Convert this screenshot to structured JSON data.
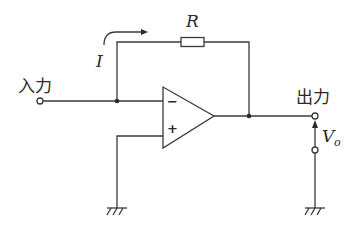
{
  "diagram": {
    "type": "circuit-schematic",
    "labels": {
      "input": "入力",
      "output": "出力",
      "current": "I",
      "resistor": "R",
      "output_voltage_main": "V",
      "output_voltage_sub": "o"
    },
    "opamp": {
      "inverting_sign": "−",
      "noninverting_sign": "+"
    },
    "components": [
      {
        "id": "input-terminal",
        "kind": "terminal",
        "label": "入力"
      },
      {
        "id": "feedback-resistor",
        "kind": "resistor",
        "label": "R"
      },
      {
        "id": "opamp",
        "kind": "operational-amplifier"
      },
      {
        "id": "output-terminal",
        "kind": "terminal",
        "label": "出力"
      },
      {
        "id": "ground-left",
        "kind": "ground"
      },
      {
        "id": "ground-right",
        "kind": "ground"
      }
    ],
    "colors": {
      "line": "#3a3a3a",
      "text": "#2a2a2a",
      "background": "#ffffff"
    }
  }
}
